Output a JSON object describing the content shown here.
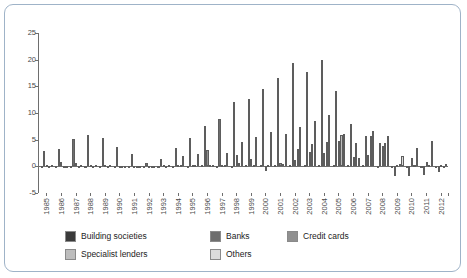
{
  "chart_data": {
    "type": "bar",
    "title": "",
    "subtitle": "",
    "xlabel": "",
    "ylabel": "",
    "ylim": [
      -5,
      25
    ],
    "yticks": [
      25,
      20,
      15,
      10,
      5,
      0,
      -5
    ],
    "grid": false,
    "legend_position": "bottom",
    "categories": [
      "1985",
      "1986",
      "1987",
      "1988",
      "1989",
      "1990",
      "1991",
      "1992",
      "1993",
      "1994",
      "1995",
      "1996",
      "1997",
      "1998",
      "1999",
      "2000",
      "2001",
      "2002",
      "2003",
      "2004",
      "2005",
      "2006",
      "2007",
      "2008",
      "2009",
      "2010",
      "2011",
      "2012"
    ],
    "series": [
      {
        "name": "Building societies",
        "color": "#3a3a3a",
        "values": [
          0.1,
          0.1,
          0.1,
          0.1,
          0.1,
          0.1,
          0.05,
          0.05,
          0.05,
          0.1,
          0.1,
          0.2,
          0.1,
          0.1,
          0.2,
          0.2,
          0.3,
          0.3,
          0.2,
          0.2,
          0.2,
          0.2,
          0.2,
          0.1,
          0.05,
          0.05,
          0.05,
          0.05
        ]
      },
      {
        "name": "Banks",
        "color": "#6e6e6e",
        "values": [
          2.9,
          3.2,
          5.1,
          5.8,
          5.4,
          3.7,
          2.4,
          0.6,
          1.3,
          3.5,
          5.4,
          7.5,
          8.8,
          12.0,
          12.6,
          14.5,
          16.6,
          19.4,
          17.6,
          19.9,
          14.2,
          7.9,
          5.7,
          4.3,
          -1.9,
          -1.9,
          -1.7,
          -1.1
        ]
      },
      {
        "name": "Credit cards",
        "color": "#909090",
        "values": [
          0.2,
          0.9,
          0.7,
          0.2,
          0.3,
          0.15,
          -0.3,
          -0.4,
          0.2,
          0.2,
          0.3,
          3.1,
          0.2,
          2.1,
          1.4,
          -0.8,
          0.7,
          1.1,
          2.6,
          2.5,
          4.7,
          1.7,
          2.1,
          3.9,
          0.3,
          1.6,
          0.9,
          0.3
        ]
      },
      {
        "name": "Specialist lenders",
        "color": "#bdbdbd",
        "values": [
          0.1,
          0.1,
          0.1,
          0.1,
          0.1,
          0.1,
          0.1,
          0.05,
          0.1,
          0.2,
          0.3,
          0.2,
          0.3,
          0.6,
          0.2,
          0.3,
          0.4,
          3.3,
          4.2,
          4.6,
          5.9,
          4.3,
          5.7,
          4.4,
          0.4,
          0.3,
          0.2,
          0.1
        ]
      },
      {
        "name": "Others",
        "color": "#dcdcdc",
        "values": [
          0.3,
          0.15,
          0.25,
          0.25,
          0.25,
          0.1,
          0.1,
          0.05,
          0.3,
          1.9,
          2.3,
          0.3,
          2.5,
          4.6,
          5.5,
          6.5,
          6.0,
          7.4,
          8.5,
          9.7,
          6.0,
          1.5,
          6.7,
          5.7,
          1.9,
          3.4,
          4.8,
          0.4
        ]
      }
    ]
  },
  "legend": {
    "items": [
      {
        "label": "Building societies",
        "color": "#3a3a3a"
      },
      {
        "label": "Banks",
        "color": "#6e6e6e"
      },
      {
        "label": "Credit cards",
        "color": "#909090"
      },
      {
        "label": "Specialist lenders",
        "color": "#bdbdbd"
      },
      {
        "label": "Others",
        "color": "#dcdcdc"
      }
    ]
  }
}
